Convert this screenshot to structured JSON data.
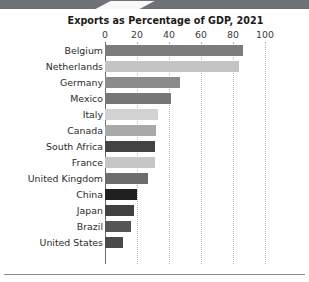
{
  "chart_data": {
    "type": "bar",
    "orientation": "horizontal",
    "title": "Exports as Percentage of GDP, 2021",
    "xlabel": "",
    "ylabel": "",
    "xlim": [
      0,
      100
    ],
    "xticks": [
      0,
      20,
      40,
      60,
      80,
      100
    ],
    "xtick_labels": [
      "0",
      "20",
      "40",
      "60",
      "80",
      "100"
    ],
    "grid": "vertical-dotted",
    "legend": "none",
    "categories": [
      "Belgium",
      "Netherlands",
      "Germany",
      "Mexico",
      "Italy",
      "Canada",
      "South Africa",
      "France",
      "United Kingdom",
      "China",
      "Japan",
      "Brazil",
      "United States"
    ],
    "values": [
      86,
      84,
      47,
      41,
      33,
      32,
      31,
      31,
      27,
      20,
      18,
      16,
      11
    ],
    "bar_colors": [
      "#7c7c7c",
      "#c3c3c3",
      "#8b8b8b",
      "#777777",
      "#d2d2d2",
      "#a9a9a9",
      "#434343",
      "#c6c6c6",
      "#6d6d6d",
      "#1f1f1f",
      "#414141",
      "#555555",
      "#4a4a4a"
    ]
  },
  "decor": {
    "banner_color": "#6e7175",
    "rule_color": "#8b8b8b"
  }
}
